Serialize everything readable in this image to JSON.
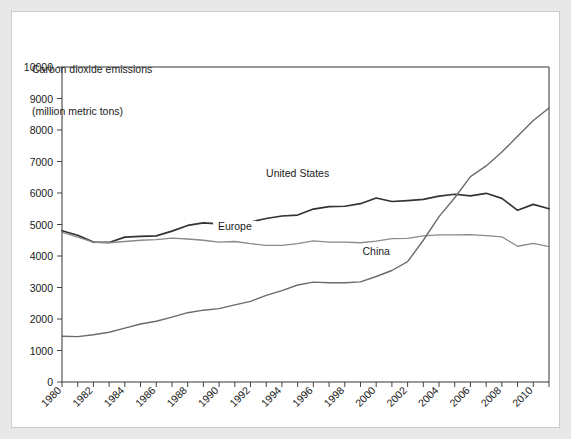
{
  "chart_data": {
    "type": "line",
    "title": "Carbon dioxide emissions\n(million metric tons)",
    "title_line1": "Carbon dioxide emissions",
    "title_line2": "(million metric tons)",
    "xlabel": "",
    "ylabel": "",
    "xlim": [
      1980,
      2011
    ],
    "ylim": [
      0,
      10000
    ],
    "ytick_step": 1000,
    "xtick_step": 1,
    "grid": false,
    "legend_position": "inline-annotations",
    "yticks": [
      0,
      1000,
      2000,
      3000,
      4000,
      5000,
      6000,
      7000,
      8000,
      9000,
      10000
    ],
    "ytick_labels": [
      "0",
      "1000",
      "2000",
      "3000",
      "4000",
      "5000",
      "6000",
      "7000",
      "8000",
      "9000",
      "10000"
    ],
    "xticks": [
      1980,
      1981,
      1982,
      1983,
      1984,
      1985,
      1986,
      1987,
      1988,
      1989,
      1990,
      1991,
      1992,
      1993,
      1994,
      1995,
      1996,
      1997,
      1998,
      1999,
      2000,
      2001,
      2002,
      2003,
      2004,
      2005,
      2006,
      2007,
      2008,
      2009,
      2010,
      2011
    ],
    "xtick_labels": [
      "1980",
      "1982",
      "1984",
      "1986",
      "1988",
      "1990",
      "1992",
      "1994",
      "1996",
      "1998",
      "2000",
      "2002",
      "2004",
      "2006",
      "2008",
      "2010"
    ],
    "xtick_labeled_years": [
      1980,
      1982,
      1984,
      1986,
      1988,
      1990,
      1992,
      1994,
      1996,
      1998,
      2000,
      2002,
      2004,
      2006,
      2008,
      2010
    ],
    "x": [
      1980,
      1981,
      1982,
      1983,
      1984,
      1985,
      1986,
      1987,
      1988,
      1989,
      1990,
      1991,
      1992,
      1993,
      1994,
      1995,
      1996,
      1997,
      1998,
      1999,
      2000,
      2001,
      2002,
      2003,
      2004,
      2005,
      2006,
      2007,
      2008,
      2009,
      2010,
      2011
    ],
    "series": [
      {
        "name": "United States",
        "color": "#333333",
        "width": 1.7,
        "label_x": 1995,
        "label_y": 6500,
        "values": [
          4800,
          4660,
          4440,
          4430,
          4600,
          4620,
          4640,
          4790,
          4970,
          5050,
          5020,
          4990,
          5080,
          5190,
          5270,
          5300,
          5490,
          5570,
          5580,
          5660,
          5840,
          5730,
          5760,
          5800,
          5900,
          5960,
          5910,
          5990,
          5830,
          5450,
          5640,
          5500
        ]
      },
      {
        "name": "Europe",
        "color": "#8a8a8a",
        "width": 1.3,
        "label_x": 1991,
        "label_y": 4830,
        "values": [
          4760,
          4600,
          4440,
          4420,
          4460,
          4500,
          4520,
          4570,
          4540,
          4500,
          4440,
          4460,
          4390,
          4340,
          4340,
          4390,
          4480,
          4440,
          4440,
          4420,
          4470,
          4550,
          4560,
          4640,
          4670,
          4670,
          4680,
          4650,
          4610,
          4310,
          4400,
          4300
        ]
      },
      {
        "name": "China",
        "color": "#6b6b6b",
        "width": 1.4,
        "label_x": 2000,
        "label_y": 4030,
        "values": [
          1450,
          1440,
          1500,
          1580,
          1710,
          1840,
          1930,
          2060,
          2200,
          2280,
          2330,
          2450,
          2560,
          2750,
          2900,
          3080,
          3170,
          3150,
          3150,
          3180,
          3350,
          3540,
          3820,
          4500,
          5250,
          5850,
          6520,
          6860,
          7300,
          7800,
          8300,
          8700
        ]
      }
    ],
    "annotations": [
      {
        "text": "United States",
        "x": 1995,
        "y": 6500
      },
      {
        "text": "Europe",
        "x": 1991,
        "y": 4830
      },
      {
        "text": "China",
        "x": 2000,
        "y": 4030
      }
    ]
  }
}
